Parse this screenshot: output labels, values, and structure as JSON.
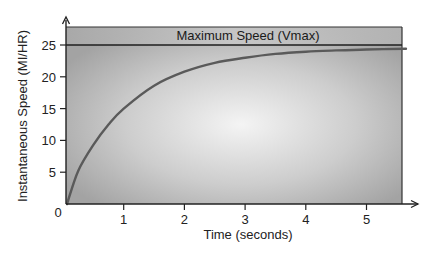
{
  "chart_data": {
    "type": "line",
    "title": "",
    "xlabel": "Time (seconds)",
    "ylabel": "Instantaneous Speed (MI/HR)",
    "xlim": [
      0,
      5.65
    ],
    "ylim": [
      0,
      27.8
    ],
    "x_ticks": [
      1,
      2,
      3,
      4,
      5
    ],
    "y_ticks": [
      5,
      10,
      15,
      20,
      25
    ],
    "origin_label": "0",
    "grid": false,
    "legend": null,
    "annotations": [
      {
        "type": "hline",
        "y": 25,
        "label": "Maximum Speed (Vmax)"
      }
    ],
    "series": [
      {
        "name": "Instantaneous Speed",
        "x": [
          0,
          0.25,
          0.5,
          0.75,
          1,
          1.5,
          2,
          2.5,
          3,
          3.5,
          4,
          4.5,
          5,
          5.65
        ],
        "values": [
          0,
          5.2,
          9.3,
          12.5,
          15.0,
          18.6,
          20.8,
          22.2,
          23.0,
          23.6,
          23.95,
          24.15,
          24.3,
          24.4
        ]
      }
    ]
  },
  "colors": {
    "plot_bg_edge": "#9a9a9a",
    "plot_bg_center": "#f2f2f2",
    "curve": "#5a5a5a",
    "axis": "#222222",
    "vmax_line": "#1e1e1e"
  }
}
